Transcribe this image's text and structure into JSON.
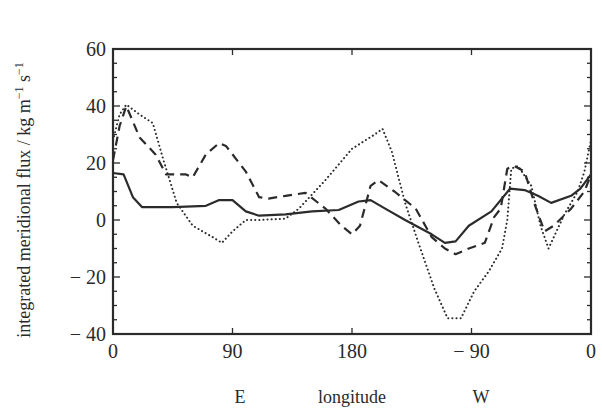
{
  "chart_data": {
    "type": "line",
    "title": "",
    "xlabel": "longitude",
    "xlabel_sides": {
      "east": "E",
      "west": "W"
    },
    "ylabel": "integrated meridional flux / kg m⁻¹ s⁻¹",
    "xlim": [
      0,
      360
    ],
    "ylim": [
      -40,
      60
    ],
    "grid": false,
    "legend": "none",
    "x_ticks": [
      {
        "pos": 0,
        "label": "0"
      },
      {
        "pos": 90,
        "label": "90"
      },
      {
        "pos": 180,
        "label": "180"
      },
      {
        "pos": 270,
        "label": "− 90"
      },
      {
        "pos": 360,
        "label": "0"
      }
    ],
    "y_ticks": [
      {
        "pos": 60,
        "label": "60"
      },
      {
        "pos": 40,
        "label": "40"
      },
      {
        "pos": 20,
        "label": "20"
      },
      {
        "pos": 0,
        "label": "0"
      },
      {
        "pos": -20,
        "label": "− 20"
      },
      {
        "pos": -40,
        "label": "− 40"
      }
    ],
    "series": [
      {
        "name": "solid",
        "style": "solid",
        "x": [
          0,
          8,
          15,
          22,
          45,
          70,
          80,
          90,
          100,
          110,
          130,
          150,
          170,
          185,
          194,
          205,
          220,
          240,
          250,
          258,
          268,
          285,
          299,
          310,
          320,
          330,
          345,
          352,
          360
        ],
        "values": [
          16.5,
          16,
          8,
          4.5,
          4.5,
          5,
          7,
          7,
          3,
          1.5,
          2,
          3,
          3.5,
          6.5,
          7,
          4,
          0,
          -5,
          -8,
          -7.5,
          -2,
          3,
          11,
          10.5,
          8.5,
          6,
          8.5,
          11,
          16
        ]
      },
      {
        "name": "dashed",
        "style": "dashed",
        "x": [
          0,
          5,
          10,
          20,
          32,
          40,
          55,
          60,
          70,
          80,
          85,
          100,
          110,
          117,
          130,
          145,
          160,
          172,
          180,
          186,
          194,
          200,
          212,
          228,
          240,
          250,
          258,
          268,
          280,
          287,
          292,
          297,
          302,
          310,
          318,
          325,
          332,
          345,
          355,
          360
        ],
        "values": [
          21,
          33,
          40,
          29,
          23,
          16,
          16,
          15,
          23,
          27,
          26,
          17,
          8,
          7.5,
          8.5,
          9.5,
          4,
          -2,
          -5,
          -2,
          12,
          14,
          10,
          4,
          -6,
          -10,
          -12,
          -10,
          -8,
          1,
          4,
          18,
          19,
          17,
          5,
          -4,
          -2,
          4,
          10,
          16
        ]
      },
      {
        "name": "dotted",
        "style": "dotted",
        "x": [
          0,
          5,
          10,
          20,
          30,
          38,
          48,
          60,
          75,
          82,
          90,
          100,
          110,
          130,
          140,
          160,
          180,
          197,
          203,
          210,
          220,
          230,
          242,
          252,
          262,
          272,
          283,
          293,
          297,
          300,
          305,
          315,
          322,
          328,
          340,
          350,
          355,
          360
        ],
        "values": [
          28,
          37,
          40.5,
          37,
          34,
          21,
          6,
          -2,
          -6,
          -8,
          -4,
          0,
          0,
          0.5,
          4,
          14,
          25,
          30,
          32,
          24,
          6,
          -8,
          -24,
          -34.5,
          -34.5,
          -25,
          -18,
          -10,
          0,
          18,
          19,
          12,
          -2,
          -10,
          2,
          10,
          17,
          28
        ]
      }
    ]
  },
  "colors": {
    "line": "#2b2b2b",
    "frame": "#2b2b2b",
    "background": "#ffffff"
  }
}
